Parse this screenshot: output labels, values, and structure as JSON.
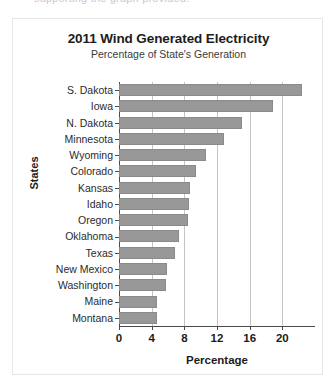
{
  "clipped_header_text": "supporting the graph provided.",
  "chart_data": {
    "type": "bar",
    "orientation": "horizontal",
    "title": "2011 Wind Generated Electricity",
    "subtitle": "Percentage of State's Generation",
    "xlabel": "Percentage",
    "ylabel": "States",
    "categories": [
      "S. Dakota",
      "Iowa",
      "N. Dakota",
      "Minnesota",
      "Wyoming",
      "Colorado",
      "Kansas",
      "Idaho",
      "Oregon",
      "Oklahoma",
      "Texas",
      "New Mexico",
      "Washington",
      "Maine",
      "Montana"
    ],
    "values": [
      22.4,
      18.9,
      15.0,
      12.8,
      10.6,
      9.4,
      8.7,
      8.6,
      8.4,
      7.4,
      6.9,
      5.9,
      5.7,
      4.6,
      4.6
    ],
    "xlim": [
      0,
      24
    ],
    "xticks": [
      0,
      4,
      8,
      12,
      16,
      20
    ],
    "xtick_labels": [
      "0",
      "4",
      "8",
      "12",
      "16",
      "20"
    ],
    "grid": "vertical",
    "legend": "none",
    "bar_color": "#989898",
    "gridline_color": "#c4c4c4",
    "axis_color": "#4a4a4a"
  }
}
